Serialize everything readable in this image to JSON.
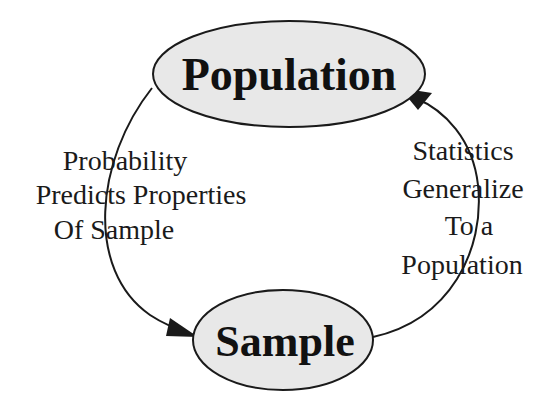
{
  "diagram": {
    "title": "",
    "colors": {
      "background": "#ffffff",
      "node_fill": "#e8e8e8",
      "stroke": "#1a1a1a",
      "text": "#111111"
    },
    "nodes": [
      {
        "id": "population",
        "label": "Population",
        "shape": "ellipse"
      },
      {
        "id": "sample",
        "label": "Sample",
        "shape": "ellipse"
      }
    ],
    "edges": [
      {
        "from": "population",
        "to": "sample",
        "side": "left",
        "label_lines": [
          "Probability",
          "Predicts Properties",
          "Of Sample"
        ]
      },
      {
        "from": "sample",
        "to": "population",
        "side": "right",
        "label_lines": [
          "Statistics",
          "Generalize",
          "To a",
          "Population"
        ]
      }
    ]
  }
}
